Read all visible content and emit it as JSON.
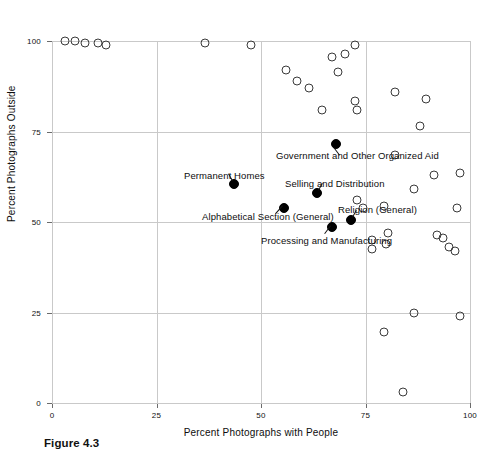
{
  "figure": {
    "caption": "Figure 4.3"
  },
  "axes": {
    "x_title": "Percent Photographs with People",
    "y_title": "Percent Photographs Outside",
    "x_ticks": [
      "0",
      "25",
      "50",
      "75",
      "100"
    ],
    "y_ticks": [
      "0",
      "25",
      "50",
      "75",
      "100"
    ]
  },
  "colors": {
    "grid": "#c9c9c9",
    "axis": "#6b6b6b",
    "open_marker": "#3a3a3a",
    "filled_marker": "#000000",
    "text": "#0d0d0d",
    "background": "#ffffff"
  },
  "chart_data": {
    "type": "scatter",
    "title": "Figure 4.3",
    "xlabel": "Percent Photographs with People",
    "ylabel": "Percent Photographs Outside",
    "xlim": [
      0,
      100
    ],
    "ylim": [
      0,
      100
    ],
    "xticks": [
      0,
      25,
      50,
      75,
      100
    ],
    "yticks": [
      0,
      25,
      50,
      75,
      100
    ],
    "grid": true,
    "legend": "none",
    "series": [
      {
        "name": "Unlabeled categories",
        "marker": "open-circle",
        "points": [
          {
            "x": 3.0,
            "y": 100.0
          },
          {
            "x": 5.5,
            "y": 100.0
          },
          {
            "x": 8.0,
            "y": 99.5
          },
          {
            "x": 11.0,
            "y": 99.5
          },
          {
            "x": 13.0,
            "y": 99.0
          },
          {
            "x": 36.5,
            "y": 99.5
          },
          {
            "x": 47.5,
            "y": 99.0
          },
          {
            "x": 56.0,
            "y": 92.0
          },
          {
            "x": 58.5,
            "y": 89.0
          },
          {
            "x": 61.5,
            "y": 87.0
          },
          {
            "x": 64.5,
            "y": 81.0
          },
          {
            "x": 67.0,
            "y": 95.5
          },
          {
            "x": 70.0,
            "y": 96.5
          },
          {
            "x": 72.5,
            "y": 99.0
          },
          {
            "x": 68.5,
            "y": 91.5
          },
          {
            "x": 72.5,
            "y": 83.5
          },
          {
            "x": 73.0,
            "y": 81.0
          },
          {
            "x": 82.0,
            "y": 86.0
          },
          {
            "x": 89.5,
            "y": 84.0
          },
          {
            "x": 88.0,
            "y": 76.5
          },
          {
            "x": 82.0,
            "y": 68.5
          },
          {
            "x": 91.5,
            "y": 63.0
          },
          {
            "x": 97.5,
            "y": 63.5
          },
          {
            "x": 86.5,
            "y": 59.0
          },
          {
            "x": 97.0,
            "y": 54.0
          },
          {
            "x": 73.0,
            "y": 56.0
          },
          {
            "x": 74.5,
            "y": 54.0
          },
          {
            "x": 79.5,
            "y": 54.5
          },
          {
            "x": 80.5,
            "y": 47.0
          },
          {
            "x": 80.0,
            "y": 44.0
          },
          {
            "x": 76.5,
            "y": 45.0
          },
          {
            "x": 76.5,
            "y": 42.5
          },
          {
            "x": 92.0,
            "y": 46.5
          },
          {
            "x": 93.5,
            "y": 45.5
          },
          {
            "x": 95.0,
            "y": 43.0
          },
          {
            "x": 96.5,
            "y": 42.0
          },
          {
            "x": 86.5,
            "y": 25.0
          },
          {
            "x": 79.5,
            "y": 19.5
          },
          {
            "x": 97.5,
            "y": 24.0
          },
          {
            "x": 84.0,
            "y": 3.0
          }
        ]
      },
      {
        "name": "Labeled categories",
        "marker": "filled-circle",
        "points": [
          {
            "x": 43.5,
            "y": 60.5,
            "label": "Permanent Homes"
          },
          {
            "x": 68.0,
            "y": 71.5,
            "label": "Government and Other Organized Aid"
          },
          {
            "x": 63.5,
            "y": 58.0,
            "label": "Selling and Distribution"
          },
          {
            "x": 55.5,
            "y": 54.0,
            "label": "Alphabetical Section (General)"
          },
          {
            "x": 71.5,
            "y": 50.5,
            "label": "Religion (General)"
          },
          {
            "x": 67.0,
            "y": 48.5,
            "label": "Processing and Manufacturing"
          }
        ]
      }
    ],
    "annotations": [
      {
        "text": "Government and Other Organized Aid",
        "px": 276,
        "py": 150,
        "leader": {
          "x1": 334,
          "y1": 147,
          "x2": 340,
          "y2": 155
        }
      },
      {
        "text": "Permanent Homes",
        "px": 184,
        "py": 170,
        "leader": {
          "x1": 232,
          "y1": 181,
          "x2": 228,
          "y2": 174
        }
      },
      {
        "text": "Selling and Distribution",
        "px": 285,
        "py": 178,
        "leader": {
          "x1": 318,
          "y1": 190,
          "x2": 322,
          "y2": 183
        }
      },
      {
        "text": "Alphabetical Section (General)",
        "px": 202,
        "py": 211,
        "leader": {
          "x1": 283,
          "y1": 206,
          "x2": 276,
          "y2": 214
        }
      },
      {
        "text": "Religion (General)",
        "px": 338,
        "py": 204,
        "leader": {
          "x1": 352,
          "y1": 217,
          "x2": 356,
          "y2": 210
        }
      },
      {
        "text": "Processing and Manufacturing",
        "px": 261,
        "py": 235,
        "leader": {
          "x1": 331,
          "y1": 226,
          "x2": 325,
          "y2": 234
        }
      }
    ]
  }
}
